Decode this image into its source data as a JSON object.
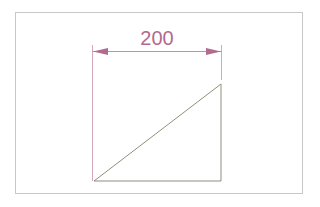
{
  "diagram": {
    "type": "technical-drawing",
    "frame": {
      "x": 15,
      "y": 12,
      "width": 287,
      "height": 181,
      "color": "#c8c8c8"
    },
    "dimension": {
      "label": "200",
      "color": "#b26a8f",
      "y": 51,
      "x1": 92,
      "x2": 221
    },
    "extension_lines": [
      {
        "x": 92,
        "y1": 45,
        "y2": 181
      },
      {
        "x": 221,
        "y1": 45,
        "y2": 80
      }
    ],
    "triangle": {
      "points": [
        [
          94,
          181
        ],
        [
          221,
          84
        ],
        [
          221,
          181
        ]
      ],
      "stroke": "#8f8f7a"
    },
    "colors": {
      "background": "#ffffff",
      "dimension": "#b26a8f",
      "geometry": "#8f8f7a",
      "frame": "#c8c8c8"
    }
  }
}
